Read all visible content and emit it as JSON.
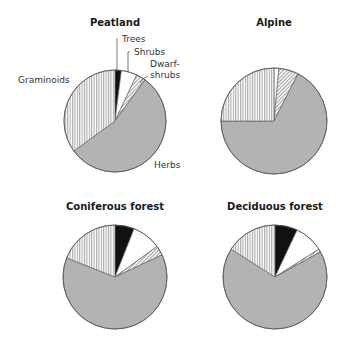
{
  "styles": {
    "Trees": {
      "fill": "#111111",
      "pattern": "solid"
    },
    "Shrubs": {
      "fill": "#ffffff",
      "pattern": "solid"
    },
    "Dwarf-shrubs": {
      "fill": "#ffffff",
      "pattern": "diagonal"
    },
    "Herbs": {
      "fill": "#b3b3b3",
      "pattern": "solid"
    },
    "Graminoids": {
      "fill": "#ffffff",
      "pattern": "vertical"
    }
  },
  "chart_data": [
    {
      "type": "pie",
      "title": "Peatland",
      "categories": [
        "Trees",
        "Shrubs",
        "Dwarf-shrubs",
        "Herbs",
        "Graminoids"
      ],
      "values": [
        2,
        5,
        3,
        55,
        35
      ],
      "layout": {
        "cx": 115,
        "cy": 121,
        "r": 51,
        "title_y": 26
      },
      "annotations": [
        {
          "text": "Trees",
          "x": 122,
          "y": 42,
          "leader": [
            [
              117,
              38
            ],
            [
              117,
              70
            ]
          ]
        },
        {
          "text": "Shrubs",
          "x": 134,
          "y": 55,
          "leader": [
            [
              130,
              52
            ],
            [
              128,
              52
            ],
            [
              128,
              72
            ]
          ]
        },
        {
          "text": "Dwarf-",
          "x": 150,
          "y": 67,
          "leader": null
        },
        {
          "text": "shrubs",
          "x": 150,
          "y": 78,
          "leader": [
            [
              148,
              76
            ],
            [
              143,
              79
            ],
            [
              140,
              83
            ]
          ]
        },
        {
          "text": "Herbs",
          "x": 154,
          "y": 168,
          "leader": null
        },
        {
          "text": "Graminoids",
          "x": 18,
          "y": 83,
          "leader": null
        }
      ]
    },
    {
      "type": "pie",
      "title": "Alpine",
      "categories": [
        "Trees",
        "Shrubs",
        "Dwarf-shrubs",
        "Herbs",
        "Graminoids"
      ],
      "values": [
        0,
        1.5,
        6,
        67.5,
        25
      ],
      "layout": {
        "cx": 274,
        "cy": 121,
        "r": 53,
        "title_y": 26
      },
      "annotations": []
    },
    {
      "type": "pie",
      "title": "Coniferous forest",
      "categories": [
        "Trees",
        "Shrubs",
        "Dwarf-shrubs",
        "Herbs",
        "Graminoids"
      ],
      "values": [
        6,
        9,
        3,
        63,
        19
      ],
      "layout": {
        "cx": 115,
        "cy": 277,
        "r": 52,
        "title_y": 210
      },
      "annotations": []
    },
    {
      "type": "pie",
      "title": "Deciduous forest",
      "categories": [
        "Trees",
        "Shrubs",
        "Dwarf-shrubs",
        "Herbs",
        "Graminoids"
      ],
      "values": [
        7,
        9,
        1,
        67,
        16
      ],
      "layout": {
        "cx": 275,
        "cy": 277,
        "r": 52,
        "title_y": 210
      },
      "annotations": []
    }
  ]
}
